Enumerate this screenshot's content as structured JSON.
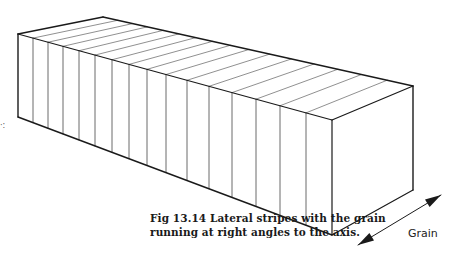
{
  "figure": {
    "caption_line1": "Fig 13.14  Lateral stripes with the grain",
    "caption_line2": "running at right angles to the axis.",
    "arrow_label": "Grain",
    "edge_mark": "·:",
    "stroke_color": "#1a1a1a",
    "stripe_color": "#444444",
    "stripe_count": 17,
    "vertices": {
      "front_top_left": [
        18,
        34
      ],
      "front_bottom_left": [
        18,
        117
      ],
      "back_top_left": [
        103,
        17
      ],
      "front_top_right": [
        332,
        120
      ],
      "front_bottom_right": [
        332,
        235
      ],
      "back_top_right": [
        413,
        86
      ],
      "back_bottom_right": [
        413,
        190
      ]
    },
    "stripe_x_positions": [
      33,
      48,
      63,
      79,
      95,
      112,
      129,
      147,
      166,
      187,
      209,
      232,
      256,
      280,
      306
    ],
    "arrow": {
      "from": [
        358,
        245
      ],
      "to": [
        441,
        195
      ]
    }
  }
}
